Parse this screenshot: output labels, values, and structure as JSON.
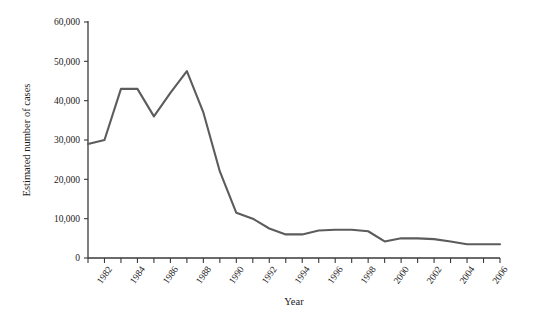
{
  "chart_data": {
    "type": "line",
    "title": "",
    "xlabel": "Year",
    "ylabel": "Estimated number of cases",
    "xlim": [
      1981,
      2006
    ],
    "ylim": [
      0,
      60000
    ],
    "grid": false,
    "legend": false,
    "line_color": "#5c5c5c",
    "axis_color": "#3a3a3a",
    "x": [
      1981,
      1982,
      1983,
      1984,
      1985,
      1986,
      1987,
      1988,
      1989,
      1990,
      1991,
      1992,
      1993,
      1994,
      1995,
      1996,
      1997,
      1998,
      1999,
      2000,
      2001,
      2002,
      2003,
      2004,
      2005,
      2006
    ],
    "values": [
      29000,
      30000,
      43000,
      43000,
      36000,
      42000,
      47500,
      37000,
      22000,
      11500,
      10000,
      7500,
      6000,
      6000,
      7000,
      7200,
      7200,
      6800,
      4200,
      5000,
      5000,
      4800,
      4200,
      3500,
      3500,
      3500
    ],
    "ytick_values": [
      0,
      10000,
      20000,
      30000,
      40000,
      50000,
      60000
    ],
    "ytick_labels": [
      "0",
      "10,000",
      "20,000",
      "30,000",
      "40,000",
      "50,000",
      "60,000"
    ],
    "xtick_values": [
      1981,
      1982,
      1983,
      1984,
      1985,
      1986,
      1987,
      1988,
      1989,
      1990,
      1991,
      1992,
      1993,
      1994,
      1995,
      1996,
      1997,
      1998,
      1999,
      2000,
      2001,
      2002,
      2003,
      2004,
      2005,
      2006
    ],
    "xtick_labels": [
      "1982",
      "1984",
      "1986",
      "1988",
      "1990",
      "1992",
      "1994",
      "1996",
      "1998",
      "2000",
      "2002",
      "2004",
      "2006"
    ],
    "xtick_label_years": [
      1982,
      1984,
      1986,
      1988,
      1990,
      1992,
      1994,
      1996,
      1998,
      2000,
      2002,
      2004,
      2006
    ]
  }
}
